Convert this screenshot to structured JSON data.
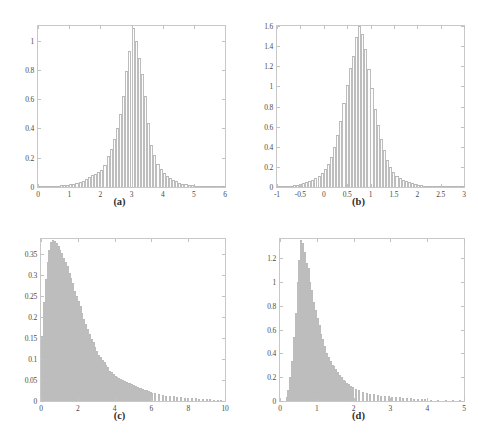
{
  "figure": {
    "background": "#ffffff",
    "bar_fill": "#fdfdfd",
    "bar_edge": "#bdbdbd",
    "axis_color": "#c8c8c8"
  },
  "panels": [
    {
      "id": "a",
      "caption": "(a)",
      "xticks": [
        "0",
        "1",
        "2",
        "3",
        "4",
        "5",
        "6"
      ],
      "yticks": [
        "0",
        "0.2",
        "0.4",
        "0.6",
        "0.8",
        "1"
      ]
    },
    {
      "id": "b",
      "caption": "(b)",
      "xticks": [
        "-1",
        "-0.5",
        "0",
        "0.5",
        "1",
        "1.5",
        "2",
        "2.5",
        "3"
      ],
      "yticks": [
        "0",
        "0.2",
        "0.4",
        "0.6",
        "0.8",
        "1",
        "1.2",
        "1.4",
        "1.6"
      ]
    },
    {
      "id": "c",
      "caption": "(c)",
      "xticks": [
        "0",
        "2",
        "4",
        "6",
        "8",
        "10"
      ],
      "yticks": [
        "0",
        "0.05",
        "0.1",
        "0.15",
        "0.2",
        "0.25",
        "0.3",
        "0.35"
      ]
    },
    {
      "id": "d",
      "caption": "(d)",
      "xticks": [
        "0",
        "1",
        "2",
        "3",
        "4",
        "5"
      ],
      "yticks": [
        "0",
        "0.2",
        "0.4",
        "0.6",
        "0.8",
        "1",
        "1.2"
      ]
    }
  ],
  "chart_data": [
    {
      "type": "bar",
      "panel": "a",
      "title": "(a)",
      "xlabel": "",
      "ylabel": "",
      "xlim": [
        0,
        6
      ],
      "ylim": [
        0,
        1.1
      ],
      "xticks": [
        0,
        1,
        2,
        3,
        4,
        5,
        6
      ],
      "yticks": [
        0,
        0.2,
        0.4,
        0.6,
        0.8,
        1
      ],
      "grid": false,
      "legend": "none",
      "description": "Normalized histogram, roughly symmetric unimodal peak near x=3",
      "bin_width": 0.1,
      "bin_centers": [
        0.05,
        0.15,
        0.25,
        0.35,
        0.45,
        0.55,
        0.65,
        0.75,
        0.85,
        0.95,
        1.05,
        1.15,
        1.25,
        1.35,
        1.45,
        1.55,
        1.65,
        1.75,
        1.85,
        1.95,
        2.05,
        2.15,
        2.25,
        2.35,
        2.45,
        2.55,
        2.65,
        2.75,
        2.85,
        2.95,
        3.05,
        3.15,
        3.25,
        3.35,
        3.45,
        3.55,
        3.65,
        3.75,
        3.85,
        3.95,
        4.05,
        4.15,
        4.25,
        4.35,
        4.45,
        4.55,
        4.65,
        4.75,
        4.85,
        4.95,
        5.05,
        5.15,
        5.25,
        5.35,
        5.45,
        5.55,
        5.65,
        5.75,
        5.85,
        5.95
      ],
      "values": [
        0.002,
        0.003,
        0.004,
        0.005,
        0.006,
        0.008,
        0.01,
        0.012,
        0.014,
        0.017,
        0.02,
        0.024,
        0.028,
        0.034,
        0.042,
        0.052,
        0.066,
        0.08,
        0.09,
        0.1,
        0.115,
        0.15,
        0.21,
        0.26,
        0.33,
        0.4,
        0.5,
        0.62,
        0.79,
        0.93,
        1.085,
        1.0,
        0.88,
        0.77,
        0.62,
        0.44,
        0.29,
        0.22,
        0.16,
        0.12,
        0.095,
        0.075,
        0.06,
        0.048,
        0.038,
        0.03,
        0.024,
        0.019,
        0.015,
        0.012,
        0.01,
        0.008,
        0.006,
        0.005,
        0.004,
        0.003,
        0.003,
        0.002,
        0.002,
        0.001
      ]
    },
    {
      "type": "bar",
      "panel": "b",
      "title": "(b)",
      "xlabel": "",
      "ylabel": "",
      "xlim": [
        -1,
        3
      ],
      "ylim": [
        0,
        1.6
      ],
      "xticks": [
        -1,
        -0.5,
        0,
        0.5,
        1,
        1.5,
        2,
        2.5,
        3
      ],
      "yticks": [
        0,
        0.2,
        0.4,
        0.6,
        0.8,
        1,
        1.2,
        1.4,
        1.6
      ],
      "grid": false,
      "legend": "none",
      "description": "Normalized histogram, sharp peak near x=0.8 reaching about 1.6",
      "bin_width": 0.0667,
      "bin_centers": [
        -0.967,
        -0.9,
        -0.833,
        -0.767,
        -0.7,
        -0.633,
        -0.567,
        -0.5,
        -0.433,
        -0.367,
        -0.3,
        -0.233,
        -0.167,
        -0.1,
        -0.033,
        0.033,
        0.1,
        0.167,
        0.233,
        0.3,
        0.367,
        0.433,
        0.5,
        0.567,
        0.633,
        0.7,
        0.767,
        0.833,
        0.9,
        0.967,
        1.033,
        1.1,
        1.167,
        1.233,
        1.3,
        1.367,
        1.433,
        1.5,
        1.567,
        1.633,
        1.7,
        1.767,
        1.833,
        1.9,
        1.967,
        2.033,
        2.1,
        2.167,
        2.233,
        2.3,
        2.367,
        2.433,
        2.5,
        2.567,
        2.633,
        2.7,
        2.767,
        2.833,
        2.9,
        2.967
      ],
      "values": [
        0.004,
        0.006,
        0.008,
        0.01,
        0.014,
        0.018,
        0.024,
        0.032,
        0.04,
        0.05,
        0.06,
        0.072,
        0.088,
        0.11,
        0.135,
        0.175,
        0.23,
        0.3,
        0.4,
        0.52,
        0.66,
        0.83,
        1.01,
        1.18,
        1.3,
        1.49,
        1.6,
        1.52,
        1.37,
        1.17,
        0.98,
        0.78,
        0.62,
        0.48,
        0.37,
        0.27,
        0.195,
        0.145,
        0.11,
        0.085,
        0.068,
        0.055,
        0.045,
        0.037,
        0.03,
        0.024,
        0.019,
        0.015,
        0.013,
        0.011,
        0.009,
        0.007,
        0.006,
        0.005,
        0.004,
        0.004,
        0.003,
        0.003,
        0.002,
        0.002
      ]
    },
    {
      "type": "bar",
      "panel": "c",
      "title": "(c)",
      "xlabel": "",
      "ylabel": "",
      "xlim": [
        0,
        10
      ],
      "ylim": [
        0,
        0.385
      ],
      "xticks": [
        0,
        2,
        4,
        6,
        8,
        10
      ],
      "yticks": [
        0,
        0.05,
        0.1,
        0.15,
        0.2,
        0.25,
        0.3,
        0.35
      ],
      "grid": false,
      "legend": "none",
      "description": "Right-skewed normalized histogram peaking near x=0.7 at about 0.38 with long tail to 10",
      "bin_width": 0.1,
      "bin_centers": [
        0.05,
        0.15,
        0.25,
        0.35,
        0.45,
        0.55,
        0.65,
        0.75,
        0.85,
        0.95,
        1.05,
        1.15,
        1.25,
        1.35,
        1.45,
        1.55,
        1.65,
        1.75,
        1.85,
        1.95,
        2.05,
        2.15,
        2.25,
        2.35,
        2.45,
        2.55,
        2.65,
        2.75,
        2.85,
        2.95,
        3.05,
        3.15,
        3.25,
        3.35,
        3.45,
        3.55,
        3.65,
        3.75,
        3.85,
        3.95,
        4.05,
        4.15,
        4.25,
        4.35,
        4.45,
        4.55,
        4.65,
        4.75,
        4.85,
        4.95,
        5.05,
        5.15,
        5.25,
        5.35,
        5.45,
        5.55,
        5.65,
        5.75,
        5.85,
        5.95,
        6.05,
        6.2,
        6.4,
        6.6,
        6.8,
        7.0,
        7.2,
        7.4,
        7.6,
        7.8,
        8.0,
        8.2,
        8.4,
        8.6,
        8.8,
        9.0,
        9.2,
        9.4,
        9.6,
        9.8
      ],
      "values": [
        0.155,
        0.235,
        0.29,
        0.33,
        0.36,
        0.378,
        0.382,
        0.38,
        0.375,
        0.368,
        0.358,
        0.352,
        0.34,
        0.33,
        0.32,
        0.305,
        0.292,
        0.28,
        0.262,
        0.25,
        0.238,
        0.225,
        0.21,
        0.196,
        0.182,
        0.17,
        0.16,
        0.148,
        0.14,
        0.128,
        0.12,
        0.11,
        0.105,
        0.098,
        0.092,
        0.086,
        0.08,
        0.072,
        0.068,
        0.064,
        0.06,
        0.057,
        0.054,
        0.052,
        0.05,
        0.048,
        0.046,
        0.044,
        0.042,
        0.04,
        0.038,
        0.036,
        0.034,
        0.032,
        0.03,
        0.028,
        0.026,
        0.025,
        0.023,
        0.022,
        0.02,
        0.018,
        0.016,
        0.015,
        0.013,
        0.012,
        0.011,
        0.01,
        0.009,
        0.008,
        0.007,
        0.006,
        0.006,
        0.005,
        0.005,
        0.004,
        0.004,
        0.003,
        0.003,
        0.002
      ]
    },
    {
      "type": "bar",
      "panel": "d",
      "title": "(d)",
      "xlabel": "",
      "ylabel": "",
      "xlim": [
        0,
        5
      ],
      "ylim": [
        0,
        1.36
      ],
      "xticks": [
        0,
        1,
        2,
        3,
        4,
        5
      ],
      "yticks": [
        0,
        0.2,
        0.4,
        0.6,
        0.8,
        1,
        1.2
      ],
      "grid": false,
      "legend": "none",
      "description": "Right-skewed normalized histogram, sharp peak near x=0.55 at about 1.35, long tail to 5",
      "bin_width": 0.05,
      "bin_centers": [
        0.175,
        0.225,
        0.275,
        0.325,
        0.375,
        0.425,
        0.475,
        0.525,
        0.575,
        0.625,
        0.675,
        0.725,
        0.775,
        0.825,
        0.875,
        0.925,
        0.975,
        1.025,
        1.075,
        1.125,
        1.175,
        1.225,
        1.275,
        1.325,
        1.375,
        1.425,
        1.475,
        1.525,
        1.575,
        1.625,
        1.675,
        1.725,
        1.775,
        1.825,
        1.875,
        1.925,
        1.975,
        2.05,
        2.15,
        2.25,
        2.35,
        2.45,
        2.55,
        2.65,
        2.75,
        2.85,
        2.95,
        3.05,
        3.15,
        3.25,
        3.35,
        3.45,
        3.55,
        3.65,
        3.75,
        3.85,
        3.95,
        4.1,
        4.3,
        4.5,
        4.7,
        4.9
      ],
      "values": [
        0.03,
        0.09,
        0.2,
        0.34,
        0.54,
        0.74,
        1.0,
        1.18,
        1.35,
        1.33,
        1.25,
        1.16,
        1.12,
        1.0,
        0.93,
        0.83,
        0.76,
        0.7,
        0.64,
        0.56,
        0.52,
        0.46,
        0.4,
        0.37,
        0.34,
        0.3,
        0.29,
        0.27,
        0.24,
        0.22,
        0.2,
        0.175,
        0.165,
        0.155,
        0.145,
        0.13,
        0.12,
        0.105,
        0.09,
        0.078,
        0.07,
        0.062,
        0.056,
        0.05,
        0.045,
        0.042,
        0.038,
        0.035,
        0.032,
        0.03,
        0.027,
        0.025,
        0.022,
        0.02,
        0.018,
        0.016,
        0.014,
        0.012,
        0.009,
        0.007,
        0.005,
        0.003
      ]
    }
  ]
}
